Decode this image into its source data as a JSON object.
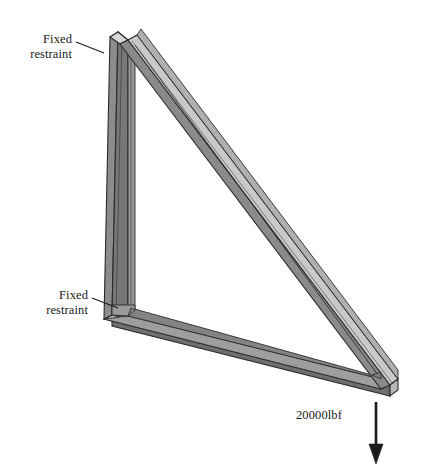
{
  "figure": {
    "type": "engineering-isometric-diagram",
    "background_color": "#ffffff"
  },
  "annotations": {
    "restraint_top": {
      "line1": "Fixed",
      "line2": "restraint",
      "leader_icon": "leader-line-icon"
    },
    "restraint_bottom": {
      "line1": "Fixed",
      "line2": "restraint",
      "leader_icon": "leader-line-icon"
    },
    "load": {
      "label": "20000lbf",
      "arrow_icon": "down-arrow-icon",
      "direction": "down"
    }
  },
  "geometry": {
    "apex_top": [
      118,
      32
    ],
    "apex_bottom_left": [
      112,
      315
    ],
    "apex_bottom_right": [
      390,
      385
    ],
    "member_depth": 10
  },
  "colors": {
    "face_light": "#c9c9c9",
    "face_mid": "#a8a8a8",
    "face_dark": "#8c8c8c",
    "face_darker": "#6f6f6f",
    "outline": "#2b2b2b",
    "text": "#1a1a1a",
    "arrow": "#1a1a1a",
    "background": "#ffffff"
  }
}
